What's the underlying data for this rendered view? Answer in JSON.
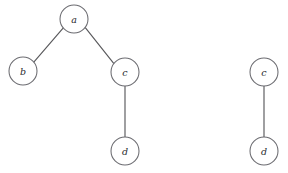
{
  "diagram": {
    "type": "undirected-graph",
    "title": "",
    "background_color": "#ffffff",
    "node_fill_color": "#ffffff",
    "node_stroke_color": "#6b6b70",
    "edge_color": "#59595c",
    "label_color": "#2a2a2e",
    "node_radius": 14,
    "components": [
      {
        "name": "left-component",
        "nodes": [
          {
            "id": "a",
            "label": "a",
            "cx": 74,
            "cy": 19
          },
          {
            "id": "b",
            "label": "b",
            "cx": 23,
            "cy": 71
          },
          {
            "id": "c",
            "label": "c",
            "cx": 125,
            "cy": 72
          },
          {
            "id": "d",
            "label": "d",
            "cx": 125,
            "cy": 151
          }
        ],
        "edges": [
          {
            "from": "a",
            "to": "b"
          },
          {
            "from": "a",
            "to": "c"
          },
          {
            "from": "c",
            "to": "d"
          }
        ]
      },
      {
        "name": "right-component",
        "nodes": [
          {
            "id": "c2",
            "label": "c",
            "cx": 264,
            "cy": 72
          },
          {
            "id": "d2",
            "label": "d",
            "cx": 264,
            "cy": 151
          }
        ],
        "edges": [
          {
            "from": "c2",
            "to": "d2"
          }
        ]
      }
    ]
  }
}
